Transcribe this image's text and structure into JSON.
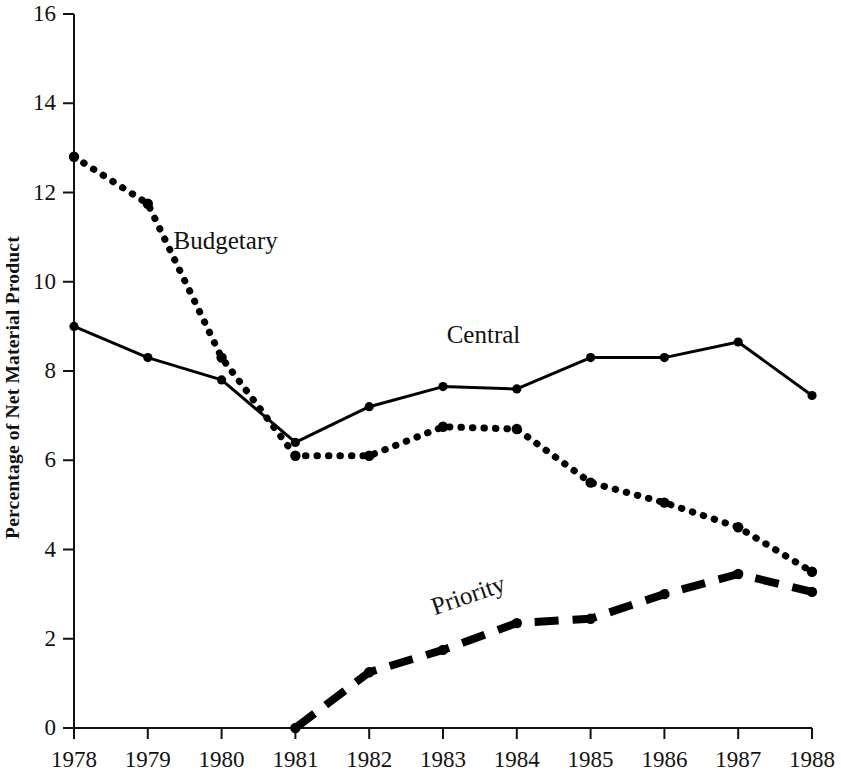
{
  "chart_data": {
    "type": "line",
    "title": "",
    "subtitle": "",
    "xlabel": "",
    "ylabel": "Percentage of Net Material Product",
    "categories": [
      "1978",
      "1979",
      "1980",
      "1981",
      "1982",
      "1983",
      "1984",
      "1985",
      "1986",
      "1987",
      "1988"
    ],
    "x": [
      1978,
      1979,
      1980,
      1981,
      1982,
      1983,
      1984,
      1985,
      1986,
      1987,
      1988
    ],
    "xlim": [
      1978,
      1988
    ],
    "ylim": [
      0,
      16
    ],
    "y_ticks": [
      0,
      2,
      4,
      6,
      8,
      10,
      12,
      14,
      16
    ],
    "x_ticks": [
      "1978",
      "1979",
      "1980",
      "1981",
      "1982",
      "1983",
      "1984",
      "1985",
      "1986",
      "1987",
      "1988"
    ],
    "grid": false,
    "legend": "inline-annotations",
    "series": [
      {
        "name": "Budgetary",
        "style": "dotted",
        "color": "#000000",
        "label_x": 1979.35,
        "label_y": 10.65,
        "values": [
          12.8,
          11.75,
          8.3,
          6.1,
          6.1,
          6.75,
          6.7,
          5.5,
          5.05,
          4.5,
          3.5
        ]
      },
      {
        "name": "Central",
        "style": "solid",
        "color": "#000000",
        "label_x": 1983.05,
        "label_y": 8.55,
        "values": [
          9.0,
          8.3,
          7.8,
          6.4,
          7.2,
          7.65,
          7.6,
          8.3,
          8.3,
          8.65,
          7.45
        ]
      },
      {
        "name": "Priority",
        "style": "dashed",
        "color": "#000000",
        "label_x": 1982.9,
        "label_y": 2.45,
        "label_rotation": -19,
        "values": [
          null,
          null,
          null,
          0.0,
          1.25,
          1.75,
          2.35,
          2.45,
          3.0,
          3.45,
          3.05
        ]
      }
    ]
  },
  "figure": {
    "background": "#ffffff",
    "axis_color": "#111111",
    "marker": "filled-circle"
  }
}
